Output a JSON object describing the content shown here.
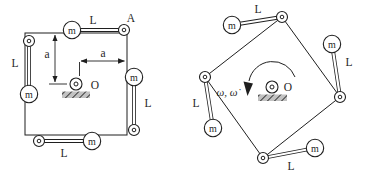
{
  "colors": {
    "ink": "#1f1f1f",
    "background": "#ffffff",
    "hatch_fill": "#c2c2c2",
    "hatch_line": "#3a3a3a"
  },
  "diagram": {
    "left_figure": {
      "corner_label": "A",
      "pivot_label": "O",
      "top_link_label": "L",
      "left_link_label": "L",
      "right_link_label": "L",
      "bottom_link_label": "L",
      "vertical_dim_label": "a",
      "horizontal_dim_label": "a",
      "masses": [
        "m",
        "m",
        "m",
        "m"
      ]
    },
    "right_figure": {
      "pivot_label": "O",
      "rotation_label": "ω, ω̇",
      "top_link_label": "L",
      "left_link_label": "L",
      "right_link_label": "L",
      "bottom_link_label": "L",
      "masses": [
        "m",
        "m",
        "m",
        "m"
      ]
    }
  }
}
